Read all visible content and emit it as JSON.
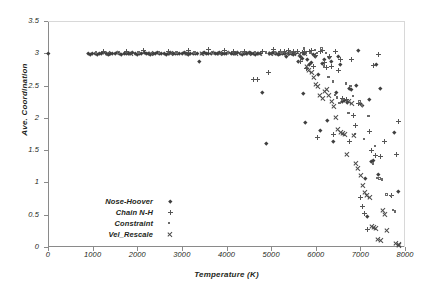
{
  "chart_data": {
    "type": "scatter",
    "title": "",
    "xlabel": "Temperature (K)",
    "ylabel": "Ave. Coordination",
    "xlim": [
      0,
      8000
    ],
    "ylim": [
      0,
      3.5
    ],
    "xticks": [
      0,
      1000,
      2000,
      3000,
      4000,
      5000,
      6000,
      7000,
      8000
    ],
    "xtick_labels": [
      "0",
      "1000",
      "2000",
      "3000",
      "4000",
      "5000",
      "6000",
      "7000",
      "8000"
    ],
    "yticks": [
      0,
      0.5,
      1,
      1.5,
      2,
      2.5,
      3,
      3.5
    ],
    "ytick_labels": [
      "0",
      "0.5",
      "1",
      "1.5",
      "2",
      "2.5",
      "3",
      "3.5"
    ],
    "grid": false,
    "legend_position": "lower-left-inside",
    "series": [
      {
        "name": "Nose-Hoover",
        "marker": "diamond",
        "color": "#3f3f3f",
        "points": [
          [
            0,
            3.0
          ],
          [
            900,
            3.0
          ],
          [
            950,
            2.99
          ],
          [
            1000,
            3.0
          ],
          [
            1050,
            3.0
          ],
          [
            1100,
            2.99
          ],
          [
            1150,
            3.0
          ],
          [
            1200,
            3.0
          ],
          [
            1250,
            3.01
          ],
          [
            1300,
            3.0
          ],
          [
            1350,
            2.99
          ],
          [
            1400,
            3.0
          ],
          [
            1450,
            3.0
          ],
          [
            1500,
            3.0
          ],
          [
            1550,
            3.01
          ],
          [
            1600,
            3.0
          ],
          [
            1650,
            2.99
          ],
          [
            1700,
            3.0
          ],
          [
            1750,
            3.0
          ],
          [
            1800,
            3.0
          ],
          [
            1850,
            3.0
          ],
          [
            1900,
            3.01
          ],
          [
            1950,
            3.0
          ],
          [
            2000,
            2.99
          ],
          [
            2050,
            3.0
          ],
          [
            2100,
            3.0
          ],
          [
            2150,
            3.02
          ],
          [
            2200,
            3.0
          ],
          [
            2250,
            3.0
          ],
          [
            2300,
            2.99
          ],
          [
            2350,
            3.0
          ],
          [
            2400,
            3.0
          ],
          [
            2450,
            3.01
          ],
          [
            2500,
            3.0
          ],
          [
            2550,
            3.0
          ],
          [
            2600,
            3.0
          ],
          [
            2650,
            2.99
          ],
          [
            2700,
            3.0
          ],
          [
            2750,
            3.01
          ],
          [
            2800,
            3.0
          ],
          [
            2850,
            3.0
          ],
          [
            2900,
            3.0
          ],
          [
            2950,
            3.0
          ],
          [
            3000,
            3.0
          ],
          [
            3050,
            3.01
          ],
          [
            3100,
            3.0
          ],
          [
            3150,
            2.99
          ],
          [
            3200,
            3.0
          ],
          [
            3250,
            3.0
          ],
          [
            3300,
            3.0
          ],
          [
            3350,
            3.0
          ],
          [
            3400,
            2.87
          ],
          [
            3450,
            3.0
          ],
          [
            3500,
            3.01
          ],
          [
            3550,
            3.0
          ],
          [
            3600,
            3.0
          ],
          [
            3650,
            3.0
          ],
          [
            3700,
            3.01
          ],
          [
            3750,
            3.0
          ],
          [
            3800,
            3.0
          ],
          [
            3850,
            3.02
          ],
          [
            3900,
            3.0
          ],
          [
            3950,
            3.0
          ],
          [
            4000,
            3.0
          ],
          [
            4050,
            3.01
          ],
          [
            4100,
            3.0
          ],
          [
            4150,
            3.0
          ],
          [
            4200,
            3.0
          ],
          [
            4250,
            3.01
          ],
          [
            4300,
            3.0
          ],
          [
            4350,
            2.99
          ],
          [
            4400,
            3.0
          ],
          [
            4450,
            3.0
          ],
          [
            4500,
            3.01
          ],
          [
            4550,
            3.0
          ],
          [
            4600,
            3.0
          ],
          [
            4650,
            2.99
          ],
          [
            4700,
            3.0
          ],
          [
            4750,
            3.0
          ],
          [
            4800,
            2.4
          ],
          [
            4900,
            1.6
          ],
          [
            4950,
            3.0
          ],
          [
            5000,
            3.0
          ],
          [
            5050,
            3.01
          ],
          [
            5100,
            3.0
          ],
          [
            5150,
            2.99
          ],
          [
            5200,
            3.0
          ],
          [
            5250,
            3.0
          ],
          [
            5300,
            3.0
          ],
          [
            5350,
            2.96
          ],
          [
            5400,
            3.0
          ],
          [
            5450,
            3.0
          ],
          [
            5500,
            2.99
          ],
          [
            5550,
            3.0
          ],
          [
            5600,
            2.88
          ],
          [
            5650,
            2.95
          ],
          [
            5700,
            2.92
          ],
          [
            5720,
            2.38
          ],
          [
            5750,
            3.0
          ],
          [
            5760,
            1.93
          ],
          [
            5800,
            2.9
          ],
          [
            5850,
            2.83
          ],
          [
            5900,
            2.86
          ],
          [
            5950,
            2.99
          ],
          [
            6000,
            2.96
          ],
          [
            6050,
            2.67
          ],
          [
            6100,
            1.8
          ],
          [
            6150,
            2.84
          ],
          [
            6200,
            2.9
          ],
          [
            6250,
            1.96
          ],
          [
            6300,
            2.94
          ],
          [
            6350,
            2.87
          ],
          [
            6400,
            1.63
          ],
          [
            6450,
            2.4
          ],
          [
            6500,
            2.95
          ],
          [
            6550,
            2.83
          ],
          [
            6600,
            2.26
          ],
          [
            6650,
            2.27
          ],
          [
            6700,
            2.24
          ],
          [
            6750,
            2.46
          ],
          [
            6800,
            2.44
          ],
          [
            6900,
            2.5
          ],
          [
            6950,
            3.05
          ],
          [
            7000,
            2.22
          ],
          [
            7050,
            2.19
          ],
          [
            7100,
            1.06
          ],
          [
            7150,
            0.47
          ],
          [
            7200,
            2.29
          ],
          [
            7250,
            1.33
          ],
          [
            7300,
            1.35
          ],
          [
            7350,
            2.83
          ],
          [
            7400,
            1.12
          ],
          [
            7450,
            2.46
          ],
          [
            7750,
            1.77
          ],
          [
            7850,
            0.86
          ]
        ]
      },
      {
        "name": "Chain N-H",
        "marker": "plus",
        "color": "#555555",
        "points": [
          [
            1250,
            3.03
          ],
          [
            1750,
            3.02
          ],
          [
            2150,
            3.04
          ],
          [
            2700,
            3.03
          ],
          [
            3150,
            3.05
          ],
          [
            3600,
            3.06
          ],
          [
            3950,
            3.04
          ],
          [
            4150,
            3.03
          ],
          [
            4400,
            3.02
          ],
          [
            4600,
            2.6
          ],
          [
            4700,
            2.6
          ],
          [
            4800,
            3.03
          ],
          [
            4950,
            2.7
          ],
          [
            5050,
            3.06
          ],
          [
            5200,
            3.03
          ],
          [
            5300,
            3.02
          ],
          [
            5400,
            3.04
          ],
          [
            5500,
            3.03
          ],
          [
            5600,
            3.02
          ],
          [
            5650,
            2.88
          ],
          [
            5700,
            3.01
          ],
          [
            5750,
            3.03
          ],
          [
            5800,
            2.76
          ],
          [
            5850,
            3.02
          ],
          [
            5900,
            3.05
          ],
          [
            5950,
            2.8
          ],
          [
            6000,
            2.97
          ],
          [
            6050,
            1.7
          ],
          [
            6100,
            3.02
          ],
          [
            6150,
            3.04
          ],
          [
            6200,
            2.86
          ],
          [
            6250,
            2.78
          ],
          [
            6300,
            2.95
          ],
          [
            6350,
            2.8
          ],
          [
            6400,
            1.75
          ],
          [
            6450,
            3.02
          ],
          [
            6500,
            2.73
          ],
          [
            6550,
            2.9
          ],
          [
            6600,
            2.3
          ],
          [
            6700,
            2.28
          ],
          [
            6750,
            1.64
          ],
          [
            6800,
            2.9
          ],
          [
            6850,
            2.04
          ],
          [
            6900,
            1.88
          ],
          [
            6950,
            2.22
          ],
          [
            7000,
            0.76
          ],
          [
            7050,
            0.62
          ],
          [
            7100,
            0.52
          ],
          [
            7150,
            0.27
          ],
          [
            7200,
            1.79
          ],
          [
            7250,
            1.49
          ],
          [
            7300,
            2.81
          ],
          [
            7350,
            1.42
          ],
          [
            7400,
            2.98
          ],
          [
            7450,
            1.4
          ],
          [
            7550,
            1.64
          ],
          [
            7700,
            0.8
          ],
          [
            7800,
            1.44
          ],
          [
            7850,
            1.95
          ]
        ]
      },
      {
        "name": "Constraint",
        "marker": "square",
        "color": "#6a6a6a",
        "points": [
          [
            1100,
            3.0
          ],
          [
            1600,
            3.0
          ],
          [
            2050,
            3.0
          ],
          [
            2500,
            3.0
          ],
          [
            2900,
            3.0
          ],
          [
            3300,
            3.0
          ],
          [
            3700,
            3.0
          ],
          [
            4050,
            3.0
          ],
          [
            4350,
            3.0
          ],
          [
            4650,
            3.0
          ],
          [
            4900,
            3.0
          ],
          [
            5100,
            3.0
          ],
          [
            5250,
            3.0
          ],
          [
            5450,
            3.0
          ],
          [
            5550,
            3.0
          ],
          [
            5750,
            3.06
          ],
          [
            5800,
            3.0
          ],
          [
            5900,
            2.99
          ],
          [
            6000,
            3.04
          ],
          [
            6050,
            2.99
          ],
          [
            6150,
            3.06
          ],
          [
            6200,
            2.78
          ],
          [
            6250,
            2.99
          ],
          [
            6300,
            2.62
          ],
          [
            6400,
            2.55
          ],
          [
            6450,
            2.34
          ],
          [
            6500,
            2.3
          ],
          [
            6550,
            2.22
          ],
          [
            6600,
            2.26
          ],
          [
            6700,
            2.52
          ],
          [
            6750,
            2.06
          ],
          [
            6800,
            2.48
          ],
          [
            6850,
            2.33
          ],
          [
            6900,
            1.74
          ],
          [
            7000,
            2.24
          ],
          [
            7050,
            2.18
          ],
          [
            7100,
            1.66
          ],
          [
            7200,
            2.02
          ],
          [
            7300,
            1.28
          ],
          [
            7350,
            1.55
          ],
          [
            7400,
            1.06
          ],
          [
            7450,
            1.05
          ],
          [
            7500,
            1.03
          ],
          [
            7600,
            0.8
          ],
          [
            7700,
            0.78
          ],
          [
            7750,
            0.56
          ],
          [
            7800,
            0.54
          ]
        ]
      },
      {
        "name": "Vel_Rescale",
        "marker": "cross",
        "color": "#4a4a4a",
        "points": [
          [
            1350,
            3.0
          ],
          [
            1850,
            3.0
          ],
          [
            2300,
            3.0
          ],
          [
            2750,
            3.0
          ],
          [
            3100,
            3.0
          ],
          [
            3450,
            3.0
          ],
          [
            3850,
            3.0
          ],
          [
            4200,
            3.0
          ],
          [
            4500,
            3.0
          ],
          [
            4750,
            3.0
          ],
          [
            5000,
            3.0
          ],
          [
            5150,
            3.0
          ],
          [
            5350,
            3.0
          ],
          [
            5500,
            2.99
          ],
          [
            5650,
            2.98
          ],
          [
            5750,
            2.99
          ],
          [
            5800,
            2.8
          ],
          [
            5850,
            2.73
          ],
          [
            5900,
            2.7
          ],
          [
            5950,
            2.62
          ],
          [
            6000,
            2.51
          ],
          [
            6050,
            2.48
          ],
          [
            6100,
            2.35
          ],
          [
            6150,
            2.3
          ],
          [
            6200,
            2.41
          ],
          [
            6250,
            2.44
          ],
          [
            6300,
            2.34
          ],
          [
            6350,
            2.25
          ],
          [
            6400,
            2.18
          ],
          [
            6450,
            2.0
          ],
          [
            6500,
            1.82
          ],
          [
            6550,
            1.78
          ],
          [
            6600,
            1.76
          ],
          [
            6650,
            1.74
          ],
          [
            6700,
            1.44
          ],
          [
            6750,
            2.26
          ],
          [
            6800,
            2.22
          ],
          [
            6850,
            1.72
          ],
          [
            6900,
            1.29
          ],
          [
            6950,
            1.21
          ],
          [
            7000,
            1.1
          ],
          [
            7050,
            0.96
          ],
          [
            7100,
            0.84
          ],
          [
            7150,
            0.8
          ],
          [
            7200,
            0.76
          ],
          [
            7250,
            0.32
          ],
          [
            7300,
            0.3
          ],
          [
            7350,
            0.28
          ],
          [
            7400,
            0.12
          ],
          [
            7450,
            0.1
          ],
          [
            7500,
            0.56
          ],
          [
            7550,
            0.5
          ],
          [
            7600,
            0.26
          ],
          [
            7800,
            0.06
          ],
          [
            7850,
            0.04
          ],
          [
            7870,
            0.02
          ]
        ]
      }
    ]
  },
  "legend": {
    "items": [
      {
        "label": "Nose-Hoover",
        "marker": "diamond"
      },
      {
        "label": "Chain N-H",
        "marker": "plus"
      },
      {
        "label": "Constraint",
        "marker": "square"
      },
      {
        "label": "Vel_Rescale",
        "marker": "cross"
      }
    ]
  }
}
